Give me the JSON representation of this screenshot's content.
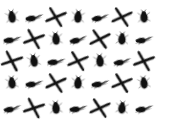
{
  "image": {
    "title": "Insect sprite grid",
    "width": 171,
    "height": 127,
    "background_color": "#ffffff",
    "ink_color": "#111111",
    "description": "Grid of small dark blurry insect silhouettes on a white background"
  },
  "grid": {
    "rows": 5,
    "columns": 7,
    "cell_width": 22,
    "cell_height": 22,
    "origin_x": 12,
    "row_y": [
      8,
      30,
      52,
      74,
      99
    ],
    "shape_types": [
      "beetle",
      "fly",
      "cross"
    ],
    "shape_labels": {
      "beetle": "beetle-silhouette",
      "fly": "fly-silhouette",
      "cross": "crane-fly-cross-silhouette"
    },
    "cells": [
      [
        "beetle",
        "fly",
        "cross",
        "beetle",
        "fly",
        "cross",
        "beetle"
      ],
      [
        "fly",
        "cross",
        "beetle",
        "fly",
        "cross",
        "beetle",
        "fly"
      ],
      [
        "cross",
        "beetle",
        "fly",
        "cross",
        "beetle",
        "fly",
        "cross"
      ],
      [
        "beetle",
        "fly",
        "cross",
        "beetle",
        "fly",
        "cross",
        "beetle"
      ],
      [
        "fly",
        "cross",
        "beetle",
        "fly",
        "cross",
        "beetle",
        "fly"
      ]
    ],
    "rotations": [
      [
        -8,
        12,
        20,
        5,
        10,
        18,
        -4
      ],
      [
        14,
        22,
        -6,
        8,
        16,
        3,
        12
      ],
      [
        24,
        -10,
        15,
        20,
        -5,
        10,
        22
      ],
      [
        -6,
        14,
        18,
        4,
        12,
        20,
        -8
      ],
      [
        10,
        24,
        -5,
        14,
        18,
        6,
        12
      ]
    ],
    "scales": [
      [
        1.0,
        0.95,
        1.05,
        1.0,
        0.92,
        1.04,
        0.98
      ],
      [
        0.95,
        1.05,
        1.0,
        0.94,
        1.06,
        0.98,
        0.93
      ],
      [
        1.06,
        1.0,
        0.95,
        1.04,
        1.0,
        0.93,
        1.05
      ],
      [
        0.98,
        0.94,
        1.05,
        1.0,
        0.95,
        1.03,
        0.97
      ],
      [
        0.93,
        1.05,
        1.0,
        0.95,
        1.04,
        0.98,
        0.94
      ]
    ],
    "total_sprites": 35
  }
}
